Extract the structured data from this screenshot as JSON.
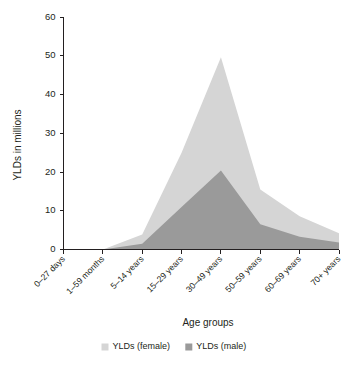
{
  "chart_data": {
    "type": "area",
    "stacked": true,
    "title": "",
    "xlabel": "Age groups",
    "ylabel": "YLDs in millions",
    "categories": [
      "0–27 days",
      "1–59 months",
      "5–14 years",
      "15–29 years",
      "30–49 years",
      "50–59 years",
      "60–69 years",
      "70+ years"
    ],
    "series": [
      {
        "name": "YLDs (male)",
        "color": "#9a9a9a",
        "values": [
          0,
          0,
          1.5,
          11.0,
          20.4,
          6.5,
          3.3,
          1.8
        ]
      },
      {
        "name": "YLDs (female)",
        "color": "#d5d5d5",
        "values": [
          0,
          0,
          2.4,
          14.0,
          29.2,
          9.0,
          5.3,
          2.4
        ]
      }
    ],
    "totals": [
      0,
      0,
      3.9,
      25.0,
      49.6,
      15.5,
      8.6,
      4.2
    ],
    "yticks": [
      0,
      10,
      20,
      30,
      40,
      50,
      60
    ],
    "ylim": [
      0,
      60
    ],
    "grid": false,
    "legend_position": "bottom",
    "xtick_rotation": 45
  },
  "legend": {
    "entries": [
      {
        "label": "YLDs (female)",
        "color": "#d5d5d5"
      },
      {
        "label": "YLDs (male)",
        "color": "#9a9a9a"
      }
    ]
  },
  "colors": {
    "female": "#d5d5d5",
    "male": "#9a9a9a",
    "axis": "#231f20",
    "background": "#ffffff"
  }
}
